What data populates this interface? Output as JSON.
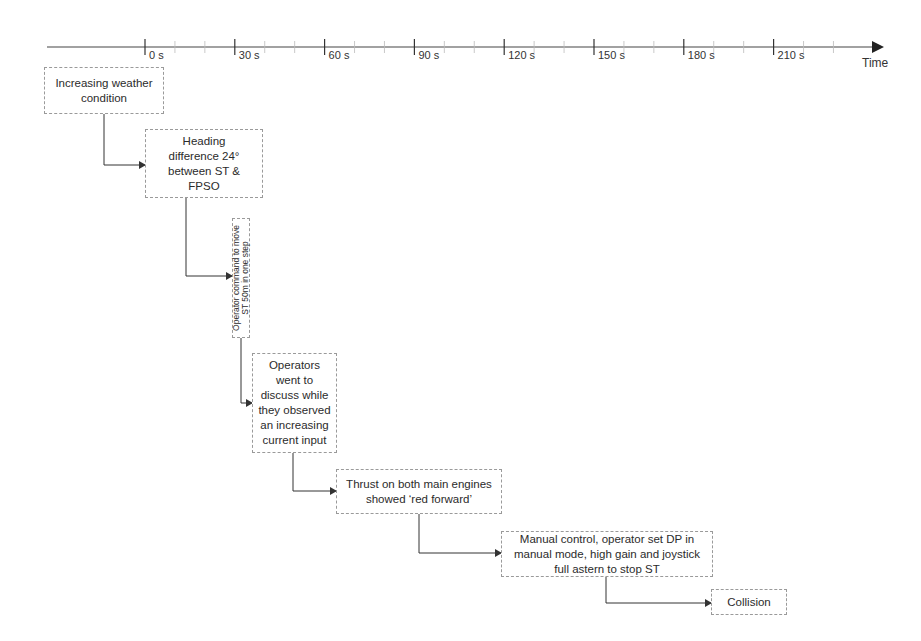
{
  "axis": {
    "label": "Time",
    "ticks": [
      "0 s",
      "30 s",
      "60 s",
      "90 s",
      "120 s",
      "150 s",
      "180 s",
      "210 s"
    ],
    "minor_interval_s": 10
  },
  "events": [
    {
      "id": "e1",
      "text": "Increasing weather\ncondition"
    },
    {
      "id": "e2",
      "text": "Heading\ndifference 24°\nbetween ST &\nFPSO"
    },
    {
      "id": "e3",
      "text": "Operator command to move\nST 50m in one step"
    },
    {
      "id": "e4",
      "text": "Operators\nwent to\ndiscuss while\nthey observed\nan increasing\ncurrent input"
    },
    {
      "id": "e5",
      "text": "Thrust on both main engines\nshowed ‘red forward’"
    },
    {
      "id": "e6",
      "text": "Manual control, operator set DP in\nmanual mode, high gain and joystick\nfull astern to stop ST"
    },
    {
      "id": "e7",
      "text": "Collision"
    }
  ],
  "colors": {
    "line": "#333333",
    "box_border": "#9a9a9a",
    "minor_tick": "#bbbbbb"
  }
}
